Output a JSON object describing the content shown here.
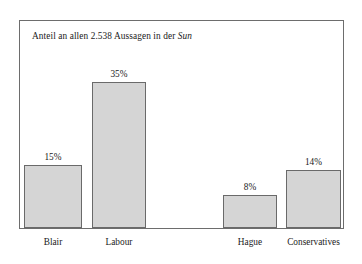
{
  "chart_data": {
    "type": "bar",
    "title": "Anteil an allen 2.538 Aussagen in der Sun",
    "title_parts": {
      "lead": "Anteil an allen 2.538 Aussagen in der ",
      "italic": "Sun"
    },
    "xlabel": "",
    "ylabel": "",
    "ylim": [
      0,
      50
    ],
    "grid": false,
    "legend": null,
    "unit": "%",
    "categories": [
      "Blair",
      "Labour",
      "Hague",
      "Conservatives"
    ],
    "values": [
      15,
      35,
      8,
      14
    ],
    "data_labels": [
      "15%",
      "35%",
      "8%",
      "14%"
    ],
    "bars": [
      {
        "category": "Blair",
        "value": 15,
        "label": "15%",
        "x": 4,
        "width": 58
      },
      {
        "category": "Labour",
        "value": 35,
        "label": "35%",
        "x": 72,
        "width": 54
      },
      {
        "category": "Hague",
        "value": 8,
        "label": "8%",
        "x": 203,
        "width": 54
      },
      {
        "category": "Conservatives",
        "value": 14,
        "label": "14%",
        "x": 266,
        "width": 55
      }
    ],
    "colors": {
      "bar_fill": "#d5d5d5",
      "bar_stroke": "#6a6a6a",
      "frame": "#6d6d6d",
      "background": "#ffffff",
      "text": "#1a1a1a"
    }
  }
}
